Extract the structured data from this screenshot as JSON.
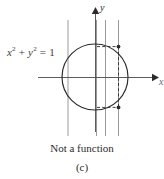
{
  "figure": {
    "panel_letter": "(c)",
    "caption": "Not a function",
    "equation": {
      "lhs_var1": "x",
      "exp1": "2",
      "plus": " + ",
      "lhs_var2": "y",
      "exp2": "2",
      "equals": " = ",
      "rhs": "1",
      "full": "x2 + y2 = 1"
    },
    "axes": {
      "y_label": "y",
      "x_label": "x",
      "origin": {
        "x": 95,
        "y": 77
      },
      "x_axis_from": {
        "x": 38,
        "y": 77
      },
      "x_axis_to": {
        "x": 158,
        "y": 77
      },
      "y_axis_from": {
        "x": 95,
        "y": 132
      },
      "y_axis_to": {
        "x": 95,
        "y": 8
      }
    },
    "circle": {
      "cx": 95,
      "cy": 77,
      "r": 33,
      "stroke": "#2b2b2b",
      "stroke_width": 1.1
    },
    "vertical_test_lines": [
      {
        "name": "vline-1",
        "x": 68,
        "y1": 20,
        "y2": 136
      },
      {
        "name": "vline-2",
        "x": 96,
        "y1": 20,
        "y2": 136
      },
      {
        "name": "vline-3",
        "x": 105,
        "y1": 20,
        "y2": 136
      },
      {
        "name": "vline-4",
        "x": 118,
        "y1": 20,
        "y2": 136
      }
    ],
    "vline_stroke": "#8e8e8e",
    "vline_stroke_width": 0.9,
    "dashed_stroke": "#2b2b2b",
    "dash_pattern": "3,2.2",
    "intersection_points": [
      {
        "name": "upper-intersection",
        "cx": 118,
        "cy": 46.6,
        "r": 1.9
      },
      {
        "name": "lower-intersection",
        "cx": 118,
        "cy": 107.4,
        "r": 1.9
      }
    ],
    "dashed_segments": [
      {
        "name": "dashed-upper-horizontal",
        "x1": 98,
        "y1": 46.6,
        "x2": 118,
        "y2": 46.6
      },
      {
        "name": "dashed-lower-horizontal",
        "x1": 98,
        "y1": 107.4,
        "x2": 118,
        "y2": 107.4
      },
      {
        "name": "dashed-vertical-chord",
        "x1": 118,
        "y1": 46.6,
        "x2": 118,
        "y2": 107.4
      }
    ],
    "colors": {
      "ink": "#2b2b2b",
      "grid": "#8e8e8e",
      "muted": "#6b6b6b",
      "background": "#ffffff"
    }
  }
}
